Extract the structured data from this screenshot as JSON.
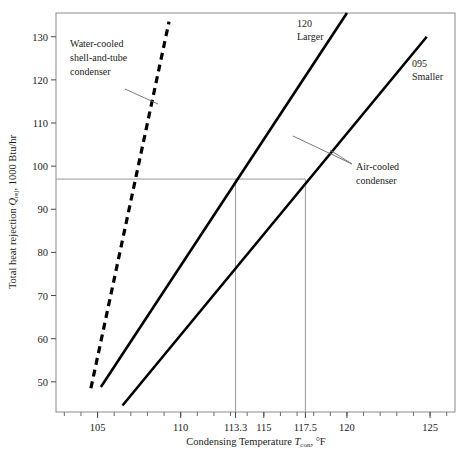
{
  "figure": {
    "background_color": "#ffffff",
    "frame_color": "#8a8a8a",
    "curve_color": "#000000",
    "guide_color": "#999999"
  },
  "axes": {
    "x_title_main": "Condensing Temperature ",
    "x_title_symbol": "T",
    "x_title_subscript": "con",
    "x_title_tail": ", °F",
    "y_title_main": "Total heat rejection ",
    "y_title_symbol": "Q",
    "y_title_subscript": "rej",
    "y_title_tail": ", 1000 Btu/hr",
    "x_ticks": [
      "105",
      "110",
      "113.3",
      "115",
      "117.5",
      "120",
      "125"
    ],
    "y_ticks": [
      "50",
      "60",
      "70",
      "80",
      "90",
      "100",
      "110",
      "120",
      "130"
    ]
  },
  "annotations": {
    "water_cooled_line1": "Water-cooled",
    "water_cooled_line2": "shell-and-tube",
    "water_cooled_line3": "condenser",
    "air_cooled_line1": "Air-cooled",
    "air_cooled_line2": "condenser",
    "curve_120_model": "120",
    "curve_120_size": "Larger",
    "curve_095_model": "095",
    "curve_095_size": "Smaller"
  },
  "chart_data": {
    "type": "line",
    "title": "",
    "xlabel": "Condensing Temperature T_con, °F",
    "ylabel": "Total heat rejection Q_rej, 1000 Btu/hr",
    "xlim": [
      102.5,
      126.5
    ],
    "ylim": [
      43,
      135.5
    ],
    "xticks": [
      105,
      110,
      113.3,
      115,
      117.5,
      120,
      125
    ],
    "yticks": [
      50,
      60,
      70,
      80,
      90,
      100,
      110,
      120,
      130
    ],
    "x_minor_tick_step": 1,
    "grid": false,
    "legend": "none",
    "series": [
      {
        "name": "Water-cooled shell-and-tube condenser",
        "style": "dashed",
        "color": "#000000",
        "x": [
          104.6,
          109.3
        ],
        "y": [
          48.5,
          133.5
        ]
      },
      {
        "name": "Air-cooled condenser 120 Larger",
        "style": "solid",
        "color": "#000000",
        "x": [
          105.2,
          120.0
        ],
        "y": [
          48.8,
          135.5
        ]
      },
      {
        "name": "Air-cooled condenser 095 Smaller",
        "style": "solid",
        "color": "#000000",
        "x": [
          106.5,
          124.8
        ],
        "y": [
          44.5,
          130.0
        ]
      }
    ],
    "reference_lines": [
      {
        "name": "heat-rejection-97",
        "orientation": "horizontal",
        "value": 97.0
      },
      {
        "name": "condensing-temp-113.3",
        "orientation": "vertical",
        "value": 113.3
      },
      {
        "name": "condensing-temp-117.5",
        "orientation": "vertical",
        "value": 117.5
      }
    ]
  }
}
